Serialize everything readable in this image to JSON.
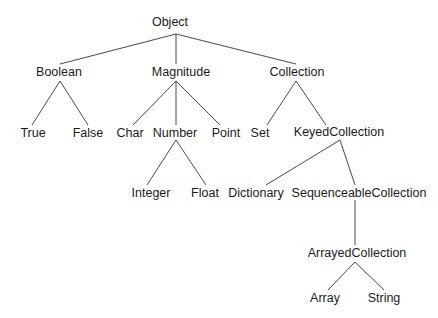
{
  "diagram": {
    "type": "class-hierarchy-tree",
    "line_color": "#333333",
    "nodes": [
      {
        "id": "Object",
        "label": "Object",
        "x": 170,
        "y": 22
      },
      {
        "id": "Boolean",
        "label": "Boolean",
        "x": 59,
        "y": 72
      },
      {
        "id": "Magnitude",
        "label": "Magnitude",
        "x": 181,
        "y": 72
      },
      {
        "id": "Collection",
        "label": "Collection",
        "x": 297,
        "y": 72
      },
      {
        "id": "True",
        "label": "True",
        "x": 33,
        "y": 133
      },
      {
        "id": "False",
        "label": "False",
        "x": 88,
        "y": 133
      },
      {
        "id": "Char",
        "label": "Char",
        "x": 130,
        "y": 133
      },
      {
        "id": "Number",
        "label": "Number",
        "x": 175,
        "y": 133
      },
      {
        "id": "Point",
        "label": "Point",
        "x": 226,
        "y": 133
      },
      {
        "id": "Set",
        "label": "Set",
        "x": 260,
        "y": 133
      },
      {
        "id": "KeyedCollection",
        "label": "KeyedCollection",
        "x": 339,
        "y": 132
      },
      {
        "id": "Integer",
        "label": "Integer",
        "x": 151,
        "y": 193
      },
      {
        "id": "Float",
        "label": "Float",
        "x": 205,
        "y": 193
      },
      {
        "id": "Dictionary",
        "label": "Dictionary",
        "x": 256,
        "y": 193
      },
      {
        "id": "SequenceableCollection",
        "label": "SequenceableCollection",
        "x": 359,
        "y": 193
      },
      {
        "id": "ArrayedCollection",
        "label": "ArrayedCollection",
        "x": 357,
        "y": 253
      },
      {
        "id": "Array",
        "label": "Array",
        "x": 325,
        "y": 298
      },
      {
        "id": "String",
        "label": "String",
        "x": 384,
        "y": 298
      }
    ],
    "edges": [
      {
        "from": "Object",
        "to": "Boolean",
        "x1": 176,
        "y1": 34,
        "x2": 60,
        "y2": 64
      },
      {
        "from": "Object",
        "to": "Magnitude",
        "x1": 176,
        "y1": 34,
        "x2": 176,
        "y2": 64
      },
      {
        "from": "Object",
        "to": "Collection",
        "x1": 176,
        "y1": 34,
        "x2": 296,
        "y2": 64
      },
      {
        "from": "Boolean",
        "to": "True",
        "x1": 60,
        "y1": 81,
        "x2": 32,
        "y2": 125
      },
      {
        "from": "Boolean",
        "to": "False",
        "x1": 60,
        "y1": 81,
        "x2": 88,
        "y2": 125
      },
      {
        "from": "Magnitude",
        "to": "Char",
        "x1": 176,
        "y1": 81,
        "x2": 133,
        "y2": 125
      },
      {
        "from": "Magnitude",
        "to": "Number",
        "x1": 176,
        "y1": 81,
        "x2": 176,
        "y2": 125
      },
      {
        "from": "Magnitude",
        "to": "Point",
        "x1": 176,
        "y1": 81,
        "x2": 220,
        "y2": 125
      },
      {
        "from": "Collection",
        "to": "Set",
        "x1": 296,
        "y1": 81,
        "x2": 267,
        "y2": 125
      },
      {
        "from": "Collection",
        "to": "KeyedCollection",
        "x1": 296,
        "y1": 81,
        "x2": 326,
        "y2": 125
      },
      {
        "from": "Number",
        "to": "Integer",
        "x1": 176,
        "y1": 140,
        "x2": 147,
        "y2": 185
      },
      {
        "from": "Number",
        "to": "Float",
        "x1": 176,
        "y1": 140,
        "x2": 206,
        "y2": 185
      },
      {
        "from": "KeyedCollection",
        "to": "Dictionary",
        "x1": 340,
        "y1": 140,
        "x2": 266,
        "y2": 185
      },
      {
        "from": "KeyedCollection",
        "to": "SequenceableCollection",
        "x1": 340,
        "y1": 140,
        "x2": 355,
        "y2": 185
      },
      {
        "from": "SequenceableCollection",
        "to": "ArrayedCollection",
        "x1": 355,
        "y1": 200,
        "x2": 355,
        "y2": 245
      },
      {
        "from": "ArrayedCollection",
        "to": "Array",
        "x1": 355,
        "y1": 262,
        "x2": 328,
        "y2": 290
      },
      {
        "from": "ArrayedCollection",
        "to": "String",
        "x1": 355,
        "y1": 262,
        "x2": 384,
        "y2": 290
      }
    ]
  }
}
